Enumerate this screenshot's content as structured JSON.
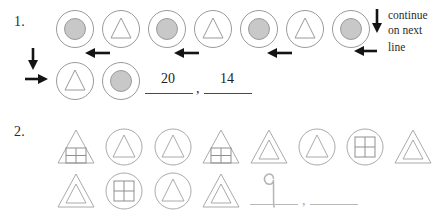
{
  "worksheet": {
    "title": "Pattern continuation worksheet",
    "problems": [
      {
        "number": "1.",
        "rows": [
          {
            "shapes": [
              "circle-with-filled-dot",
              "circle-with-triangle",
              "circle-with-filled-dot",
              "circle-with-triangle",
              "circle-with-filled-dot",
              "circle-with-triangle",
              "circle-with-filled-dot"
            ]
          },
          {
            "shapes": [
              "circle-with-triangle",
              "circle-with-filled-dot"
            ]
          }
        ],
        "arrows": [
          "arrow-left",
          "arrow-left",
          "arrow-left",
          "arrow-left",
          "arrow-down",
          "arrow-right",
          "arrow-down-continue"
        ],
        "note_lines": [
          "continue",
          "on next",
          "line"
        ],
        "answers": [
          "20",
          "14"
        ],
        "separator": ","
      },
      {
        "number": "2.",
        "rows": [
          {
            "shapes": [
              "triangle-with-grid",
              "circle-with-triangle",
              "circle-with-triangle",
              "triangle-with-grid",
              "triangle-with-triangle",
              "circle-with-triangle",
              "circle-with-grid",
              "triangle-with-triangle"
            ]
          },
          {
            "shapes": [
              "triangle-with-triangle",
              "circle-with-grid",
              "circle-with-triangle",
              "triangle-with-triangle"
            ]
          }
        ],
        "answers": [
          "9",
          ""
        ],
        "separator": ","
      }
    ],
    "colors": {
      "ink": "#2b2b2b",
      "shape_outline": "#9a9a9a",
      "shape_fill": "#c8c8c8",
      "pencil": "#b0b0b0",
      "blank_line": "#4a4a4a",
      "background": "#ffffff"
    }
  }
}
